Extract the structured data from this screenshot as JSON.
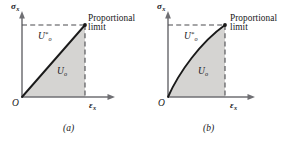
{
  "figure": {
    "panels": [
      {
        "id": "a",
        "caption": "(a)",
        "curve_type": "linear",
        "y_axis_label": "σ",
        "y_axis_subscript": "x",
        "x_axis_label": "ε",
        "x_axis_subscript": "x",
        "origin_label": "O",
        "complementary_energy_label": "U",
        "complementary_energy_sub": "o",
        "complementary_energy_sup": "*",
        "strain_energy_label": "U",
        "strain_energy_sub": "o",
        "annotation_line1": "Proportional",
        "annotation_line2": "limit"
      },
      {
        "id": "b",
        "caption": "(b)",
        "curve_type": "nonlinear",
        "y_axis_label": "σ",
        "y_axis_subscript": "x",
        "x_axis_label": "ε",
        "x_axis_subscript": "x",
        "origin_label": "O",
        "complementary_energy_label": "U",
        "complementary_energy_sub": "o",
        "complementary_energy_sup": "*",
        "strain_energy_label": "U",
        "strain_energy_sub": "o",
        "annotation_line1": "Proportional",
        "annotation_line2": "limit"
      }
    ],
    "colors": {
      "shaded_region": "#d5d4d2",
      "curve": "#1a1a1a",
      "axis": "#6f6f73",
      "dashed": "#4a4a4e",
      "text": "#17171a",
      "background": "#ffffff"
    }
  }
}
